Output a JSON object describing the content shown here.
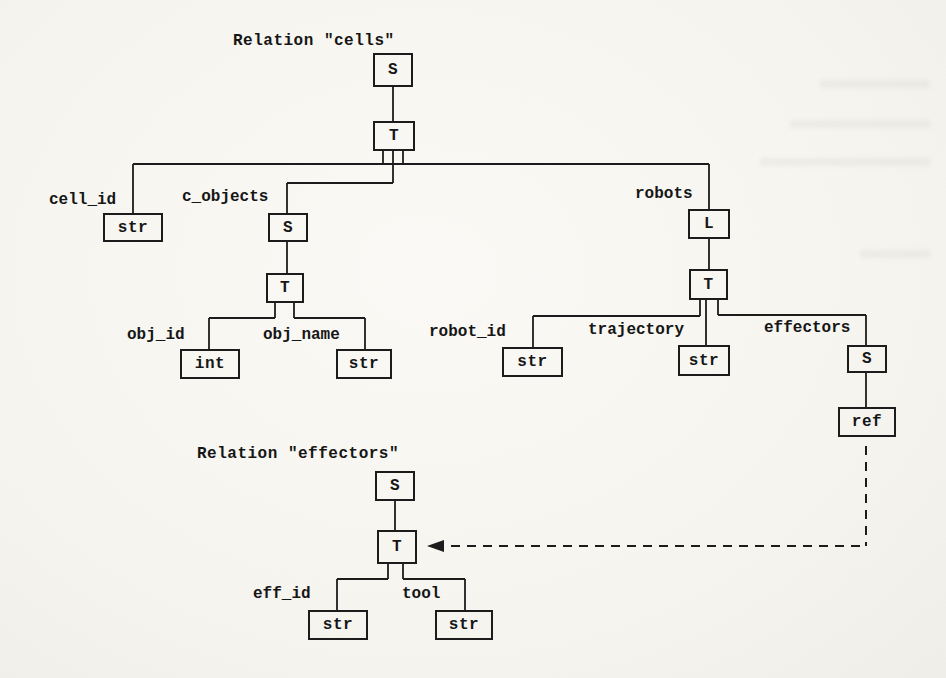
{
  "titles": {
    "cells": "Relation \"cells\"",
    "effectors": "Relation \"effectors\""
  },
  "nodes": {
    "cells_root": "S",
    "cells_tuple": "T",
    "cell_id_type": "str",
    "c_objects_set": "S",
    "c_objects_tuple": "T",
    "obj_id_type": "int",
    "obj_name_type": "str",
    "robots_list": "L",
    "robots_tuple": "T",
    "robot_id_type": "str",
    "trajectory_type": "str",
    "effectors_set": "S",
    "effectors_ref": "ref",
    "eff_root": "S",
    "eff_tuple": "T",
    "eff_id_type": "str",
    "tool_type": "str"
  },
  "labels": {
    "cell_id": "cell_id",
    "c_objects": "c_objects",
    "robots": "robots",
    "obj_id": "obj_id",
    "obj_name": "obj_name",
    "robot_id": "robot_id",
    "trajectory": "trajectory",
    "effectors": "effectors",
    "eff_id": "eff_id",
    "tool": "tool"
  },
  "colors": {
    "ink": "#1c1c1c",
    "paper": "#f6f5f0"
  }
}
